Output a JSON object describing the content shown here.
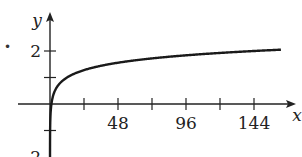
{
  "bullet": "•",
  "chart_data": {
    "type": "line",
    "title": "",
    "xlabel": "x",
    "ylabel": "y",
    "function": "y = log_12(x)",
    "x_ticks": [
      24,
      48,
      72,
      96,
      120,
      144
    ],
    "x_tick_labels": [
      "",
      "48",
      "",
      "96",
      "",
      "144"
    ],
    "y_ticks": [
      -1,
      1,
      2
    ],
    "y_tick_labels": [
      "",
      "",
      "2"
    ],
    "y_partial_label": "-2",
    "xlim": [
      -24,
      170
    ],
    "ylim": [
      -2,
      2.4
    ],
    "grid": false,
    "legend": null,
    "series": [
      {
        "name": "y = log12 x",
        "x": [
          0.2,
          0.5,
          1,
          2,
          4,
          8,
          12,
          24,
          48,
          72,
          96,
          120,
          144,
          163
        ],
        "values": [
          -0.65,
          -0.28,
          0,
          0.28,
          0.56,
          0.84,
          1.0,
          1.28,
          1.56,
          1.72,
          1.84,
          1.93,
          2.0,
          2.05
        ]
      }
    ]
  }
}
